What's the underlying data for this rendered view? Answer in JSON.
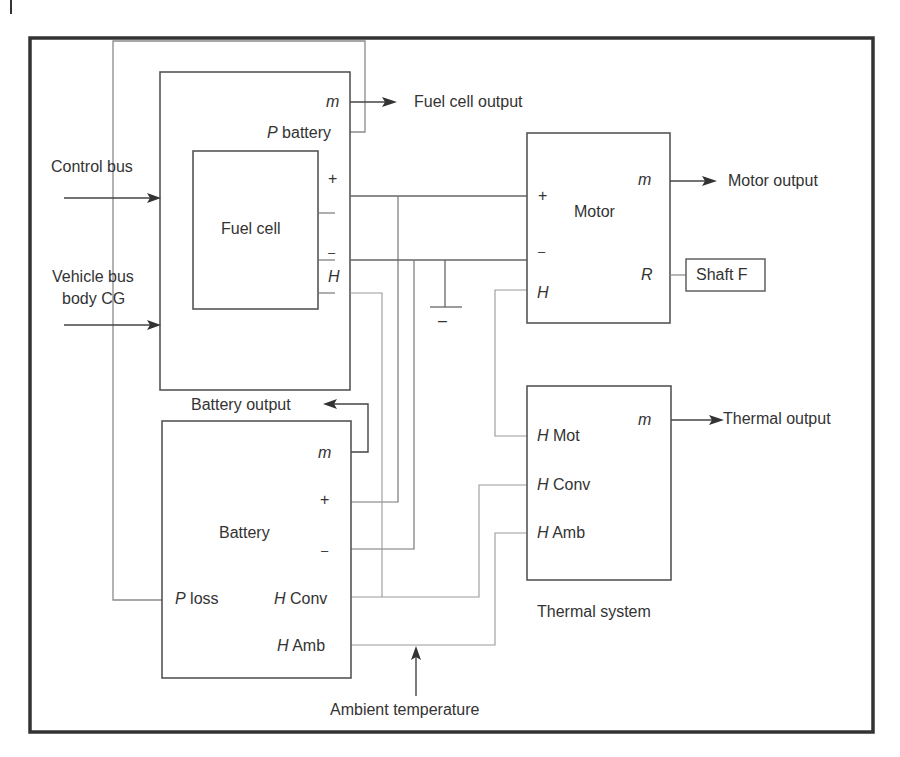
{
  "diagram": {
    "type": "block-diagram",
    "colors": {
      "line": "#555555",
      "thin_line": "#8a8a8a",
      "frame": "#333333",
      "background": "#ffffff"
    },
    "inputs": {
      "control_bus": "Control bus",
      "vehicle_bus_line1": "Vehicle bus",
      "vehicle_bus_line2": "body CG",
      "ambient_temperature": "Ambient temperature"
    },
    "blocks": {
      "fuel_cell_system": {
        "inner_label": "Fuel cell",
        "ports": {
          "m": "m",
          "p_battery_p": "P",
          "p_battery_rest": " battery",
          "plus": "+",
          "minus": "–",
          "h": "H"
        },
        "output_label": "Fuel cell output"
      },
      "motor": {
        "label": "Motor",
        "ports": {
          "plus": "+",
          "minus": "–",
          "h": "H",
          "m": "m",
          "r": "R"
        },
        "output_label": "Motor output",
        "shaft_label": "Shaft F"
      },
      "battery": {
        "label": "Battery",
        "ports": {
          "m": "m",
          "plus": "+",
          "minus": "–",
          "p_loss_p": "P",
          "p_loss_rest": " loss",
          "h_conv_h": "H",
          "h_conv_rest": " Conv",
          "h_amb_h": "H",
          "h_amb_rest": " Amb"
        },
        "output_label": "Battery output"
      },
      "thermal_system": {
        "label": "Thermal system",
        "ports": {
          "h_mot_h": "H",
          "h_mot_rest": " Mot",
          "h_conv_h": "H",
          "h_conv_rest": " Conv",
          "h_amb_h": "H",
          "h_amb_rest": " Amb",
          "m": "m"
        },
        "output_label": "Thermal output"
      }
    },
    "ground_symbol": "–"
  }
}
